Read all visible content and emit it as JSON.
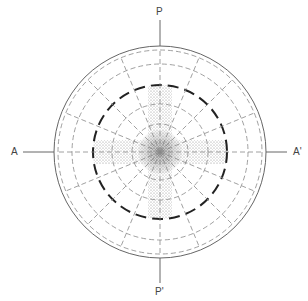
{
  "figure": {
    "labels": {
      "top": "P",
      "bottom": "P'",
      "left": "A",
      "right": "A'"
    },
    "colors": {
      "line": "#555555",
      "dashed": "#777777",
      "bold_dashed": "#222222",
      "stipple": "#666666",
      "background": "#ffffff"
    },
    "geometry": {
      "center": [
        160,
        152
      ],
      "outer_circle_radius": 106,
      "dashed_circle_radii": [
        102,
        88,
        48,
        28
      ],
      "bold_dashed_circle_radius": 67,
      "radial_line_step_deg": 22.5
    }
  }
}
